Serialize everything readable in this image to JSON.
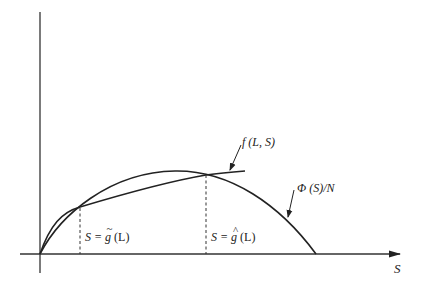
{
  "diagram": {
    "type": "economics-curve-diagram",
    "x_axis": {
      "label": "S"
    },
    "y_axis": {
      "label": ""
    },
    "curves": [
      {
        "id": "f",
        "label": "f (L, S)"
      },
      {
        "id": "phi",
        "label": "Φ (S)/N"
      }
    ],
    "markers": [
      {
        "id": "g-tilde",
        "label_prefix": "S = ",
        "func": "g",
        "accent": "~",
        "label_suffix": " (L)"
      },
      {
        "id": "g-hat",
        "label_prefix": "S = ",
        "func": "g",
        "accent": "^",
        "label_suffix": " (L)"
      }
    ],
    "colors": {
      "line": "#222222",
      "background": "#ffffff"
    }
  }
}
